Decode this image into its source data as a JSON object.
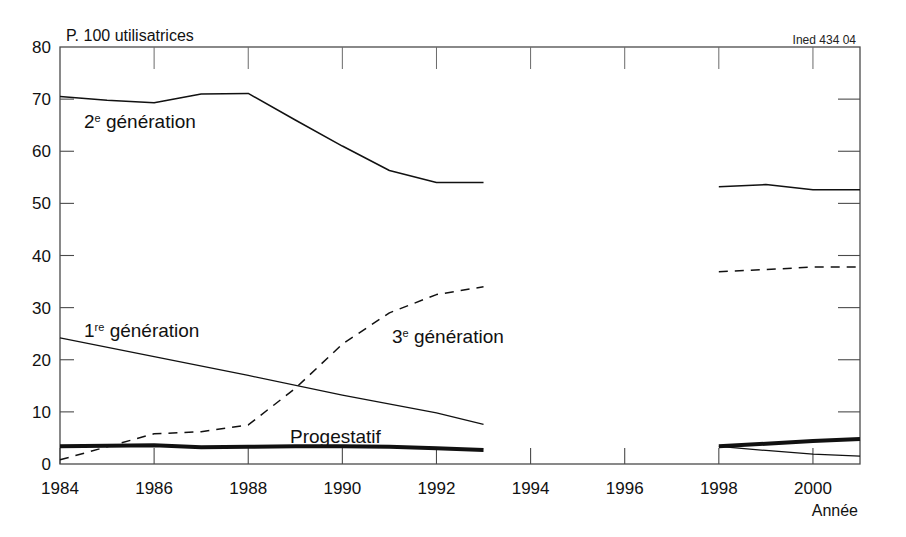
{
  "figure": {
    "unit_label": "P. 100 utilisatrices",
    "source_label": "Ined 434 04",
    "xlabel": "Année"
  },
  "axis": {
    "y_ticks": [
      "0",
      "10",
      "20",
      "30",
      "40",
      "50",
      "60",
      "70",
      "80"
    ],
    "x_ticks": [
      "1984",
      "1986",
      "1988",
      "1990",
      "1992",
      "1994",
      "1996",
      "1998",
      "2000"
    ]
  },
  "labels": {
    "gen2": "2",
    "gen2_sup": "e",
    "gen2_rest": " génération",
    "gen1": "1",
    "gen1_sup": "re",
    "gen1_rest": " génération",
    "gen3": "3",
    "gen3_sup": "e",
    "gen3_rest": " génération",
    "progestatif": "Progestatif"
  },
  "colors": {
    "line": "#111111",
    "frame": "#4a4a4a",
    "background": "#ffffff"
  },
  "chart_data": {
    "type": "line",
    "title": "",
    "subtitle": "",
    "xlabel": "Année",
    "ylabel": "P. 100 utilisatrices",
    "xlim": [
      1984,
      2001
    ],
    "ylim": [
      0,
      80
    ],
    "xticks": [
      1984,
      1986,
      1988,
      1990,
      1992,
      1994,
      1996,
      1998,
      2000
    ],
    "yticks": [
      0,
      10,
      20,
      30,
      40,
      50,
      60,
      70,
      80
    ],
    "grid": false,
    "legend": "inline-annotations",
    "note": "Data interrupted between 1993 and 1998 (no survey); two separate panels.",
    "series": [
      {
        "name": "2e génération",
        "style": "solid",
        "linewidth": 1.5,
        "segments": [
          {
            "x": [
              1984,
              1985,
              1986,
              1987,
              1988,
              1989,
              1990,
              1991,
              1992,
              1993
            ],
            "y": [
              70.5,
              69.8,
              69.3,
              71.0,
              71.1,
              66.0,
              61.0,
              56.3,
              54.0,
              54.0
            ]
          },
          {
            "x": [
              1998,
              1999,
              2000,
              2001
            ],
            "y": [
              53.2,
              53.6,
              52.6,
              52.6
            ]
          }
        ]
      },
      {
        "name": "3e génération",
        "style": "dashed",
        "linewidth": 1.5,
        "segments": [
          {
            "x": [
              1984,
              1985,
              1986,
              1987,
              1988,
              1989,
              1990,
              1991,
              1992,
              1993
            ],
            "y": [
              0.8,
              3.3,
              5.8,
              6.2,
              7.5,
              14.5,
              23.0,
              29.0,
              32.5,
              34.0
            ]
          },
          {
            "x": [
              1998,
              1999,
              2000,
              2001
            ],
            "y": [
              36.9,
              37.3,
              37.8,
              37.8
            ]
          }
        ]
      },
      {
        "name": "1re génération",
        "style": "solid",
        "linewidth": 1.2,
        "segments": [
          {
            "x": [
              1984,
              1986,
              1988,
              1990,
              1992,
              1993
            ],
            "y": [
              24.2,
              20.6,
              17.0,
              13.2,
              9.8,
              7.6
            ]
          },
          {
            "x": [
              1998,
              1999,
              2000,
              2001
            ],
            "y": [
              3.4,
              2.6,
              1.9,
              1.5
            ]
          }
        ]
      },
      {
        "name": "Progestatif",
        "style": "solid-thick",
        "linewidth": 4,
        "segments": [
          {
            "x": [
              1984,
              1985,
              1986,
              1987,
              1988,
              1989,
              1990,
              1991,
              1992,
              1993
            ],
            "y": [
              3.4,
              3.5,
              3.6,
              3.2,
              3.3,
              3.4,
              3.4,
              3.3,
              3.0,
              2.7
            ]
          },
          {
            "x": [
              1998,
              1999,
              2000,
              2001
            ],
            "y": [
              3.4,
              3.9,
              4.4,
              4.8
            ]
          }
        ]
      }
    ],
    "annotations": [
      {
        "text": "2e génération",
        "x": 1985.5,
        "y": 66.0
      },
      {
        "text": "1re génération",
        "x": 1985.2,
        "y": 24.5
      },
      {
        "text": "3e génération",
        "x": 1990.0,
        "y": 26.0
      },
      {
        "text": "Progestatif",
        "x": 1989.8,
        "y": 6.5
      }
    ]
  }
}
